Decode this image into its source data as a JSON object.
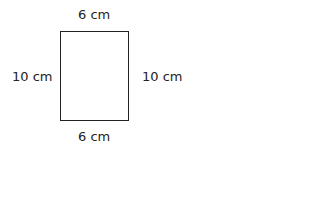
{
  "diagram": {
    "shape": "rectangle",
    "labels": {
      "top": "6 cm",
      "bottom": "6 cm",
      "left": "10 cm",
      "right": "10 cm"
    },
    "colors": {
      "stroke": "#222222",
      "background": "#ffffff"
    }
  }
}
